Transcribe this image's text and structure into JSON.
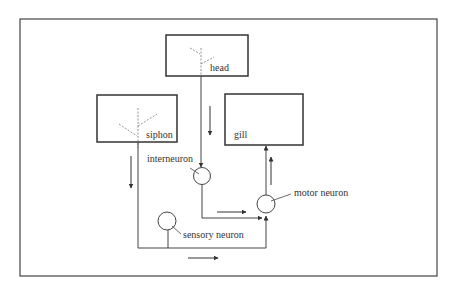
{
  "diagram": {
    "type": "neural-circuit",
    "colors": {
      "line": "#333333",
      "background": "#ffffff",
      "dashed": "#777777"
    },
    "boxes": [
      {
        "id": "head",
        "label": "head"
      },
      {
        "id": "siphon",
        "label": "siphon"
      },
      {
        "id": "gill",
        "label": "gill"
      }
    ],
    "neurons": [
      {
        "id": "interneuron",
        "label": "interneuron"
      },
      {
        "id": "motor-neuron",
        "label": "motor neuron"
      },
      {
        "id": "sensory-neuron",
        "label": "sensory neuron"
      }
    ],
    "flow_arrows": [
      {
        "id": "head-down",
        "direction": "down"
      },
      {
        "id": "siphon-down",
        "direction": "down"
      },
      {
        "id": "interneuron-right",
        "direction": "right"
      },
      {
        "id": "bottom-right",
        "direction": "right"
      },
      {
        "id": "motor-up",
        "direction": "up"
      }
    ]
  }
}
